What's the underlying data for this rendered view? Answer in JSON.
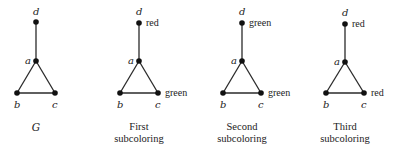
{
  "diagram": {
    "panels": [
      {
        "id": "G",
        "caption_lines": [
          "G"
        ],
        "caption_italic": true,
        "vertices": {
          "d": {
            "label": "d",
            "color_label": ""
          },
          "a": {
            "label": "a",
            "color_label": ""
          },
          "b": {
            "label": "b",
            "color_label": ""
          },
          "c": {
            "label": "c",
            "color_label": ""
          }
        }
      },
      {
        "id": "first",
        "caption_lines": [
          "First",
          "subcoloring"
        ],
        "caption_italic": false,
        "vertices": {
          "d": {
            "label": "d",
            "color_label": "red"
          },
          "a": {
            "label": "a",
            "color_label": ""
          },
          "b": {
            "label": "b",
            "color_label": ""
          },
          "c": {
            "label": "c",
            "color_label": "green"
          }
        }
      },
      {
        "id": "second",
        "caption_lines": [
          "Second",
          "subcoloring"
        ],
        "caption_italic": false,
        "vertices": {
          "d": {
            "label": "d",
            "color_label": "green"
          },
          "a": {
            "label": "a",
            "color_label": ""
          },
          "b": {
            "label": "b",
            "color_label": ""
          },
          "c": {
            "label": "c",
            "color_label": "green"
          }
        }
      },
      {
        "id": "third",
        "caption_lines": [
          "Third",
          "subcoloring"
        ],
        "caption_italic": false,
        "vertices": {
          "d": {
            "label": "d",
            "color_label": "red"
          },
          "a": {
            "label": "a",
            "color_label": ""
          },
          "b": {
            "label": "b",
            "color_label": ""
          },
          "c": {
            "label": "c",
            "color_label": "red"
          }
        }
      }
    ],
    "edges": [
      [
        "d",
        "a"
      ],
      [
        "a",
        "b"
      ],
      [
        "a",
        "c"
      ],
      [
        "b",
        "c"
      ]
    ]
  }
}
